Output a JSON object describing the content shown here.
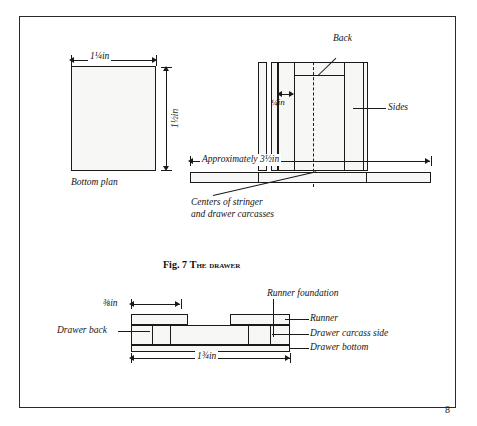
{
  "page": {
    "number": "8",
    "figure_caption_prefix": "Fig. 7 ",
    "figure_caption_title": "The drawer"
  },
  "bottom_plan": {
    "label": "Bottom plan",
    "width_dim": "1¼in",
    "height_dim": "1½in"
  },
  "drawer_elevation": {
    "back_label": "Back",
    "sides_label": "Sides",
    "quarter_dim": "¼in",
    "overall_dim": "Approximately 3½in",
    "centers_note_line1": "Centers of stringer",
    "centers_note_line2": "and drawer carcasses"
  },
  "drawer_section": {
    "runner_foundation_label": "Runner foundation",
    "runner_label": "Runner",
    "carcass_side_label": "Drawer carcass side",
    "drawer_bottom_label": "Drawer bottom",
    "drawer_back_label": "Drawer back",
    "small_dim": "⅜in",
    "overall_dim": "1¾in"
  },
  "colors": {
    "ink": "#1a1a1a",
    "paper": "#ffffff",
    "fill": "#f7f7f5",
    "surround": "#b9b9b2"
  }
}
